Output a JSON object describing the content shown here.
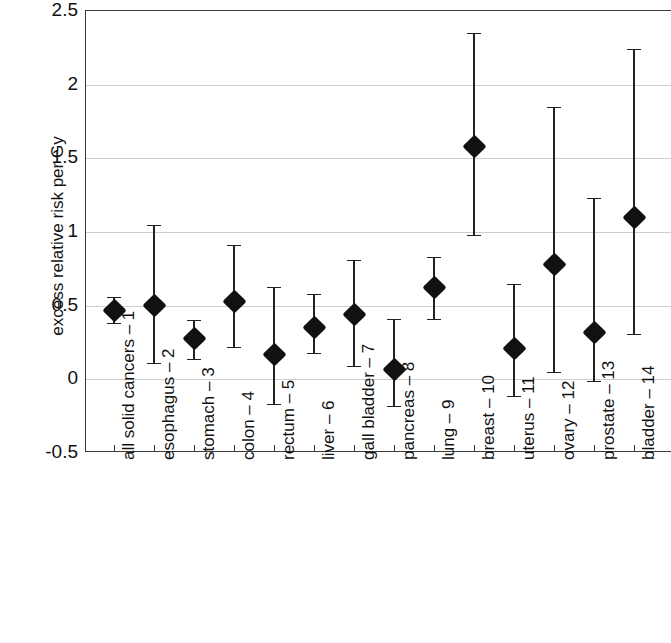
{
  "chart_data": {
    "type": "scatter",
    "title": "",
    "subtitle": "",
    "xlabel": "",
    "ylabel": "excess relative risk per Gy",
    "ylim": [
      -0.5,
      2.5
    ],
    "yticks": [
      -0.5,
      0,
      0.5,
      1,
      1.5,
      2,
      2.5
    ],
    "ytick_labels": [
      "-0.5",
      "0",
      "0.5",
      "1",
      "1.5",
      "2",
      "2.5"
    ],
    "grid": true,
    "legend": "none",
    "marker": "filled-diamond",
    "error_bars": "vertical-with-caps",
    "categories": [
      "all solid cancers – 1",
      "esophagus – 2",
      "stomach – 3",
      "colon – 4",
      "rectum – 5",
      "liver – 6",
      "gall bladder – 7",
      "pancreas – 8",
      "lung – 9",
      "breast – 10",
      "uterus – 11",
      "ovary – 12",
      "prostate – 13",
      "bladder – 14"
    ],
    "xtick_labels": [
      "all solid cancers – 1",
      "esophagus – 2",
      "stomach – 3",
      "colon – 4",
      "rectum – 5",
      "liver – 6",
      "gall bladder – 7",
      "pancreas – 8",
      "lung – 9",
      "breast – 10",
      "uterus – 11",
      "ovary – 12",
      "prostate – 13",
      "bladder – 14"
    ],
    "values": [
      0.47,
      0.5,
      0.28,
      0.53,
      0.17,
      0.35,
      0.44,
      0.07,
      0.62,
      1.58,
      0.21,
      0.78,
      0.32,
      1.1
    ],
    "error_low": [
      0.38,
      0.11,
      0.14,
      0.22,
      -0.17,
      0.18,
      0.09,
      -0.18,
      0.41,
      0.98,
      -0.11,
      0.05,
      -0.01,
      0.31
    ],
    "error_high": [
      0.56,
      1.05,
      0.4,
      0.91,
      0.63,
      0.58,
      0.81,
      0.41,
      0.83,
      2.35,
      0.65,
      1.85,
      1.23,
      2.24
    ],
    "points": [
      {
        "label": "all solid cancers – 1",
        "index": 1,
        "value": 0.47,
        "low": 0.38,
        "high": 0.56
      },
      {
        "label": "esophagus – 2",
        "index": 2,
        "value": 0.5,
        "low": 0.11,
        "high": 1.05
      },
      {
        "label": "stomach – 3",
        "index": 3,
        "value": 0.28,
        "low": 0.14,
        "high": 0.4
      },
      {
        "label": "colon – 4",
        "index": 4,
        "value": 0.53,
        "low": 0.22,
        "high": 0.91
      },
      {
        "label": "rectum – 5",
        "index": 5,
        "value": 0.17,
        "low": -0.17,
        "high": 0.63
      },
      {
        "label": "liver – 6",
        "index": 6,
        "value": 0.35,
        "low": 0.18,
        "high": 0.58
      },
      {
        "label": "gall bladder – 7",
        "index": 7,
        "value": 0.44,
        "low": 0.09,
        "high": 0.81
      },
      {
        "label": "pancreas – 8",
        "index": 8,
        "value": 0.07,
        "low": -0.18,
        "high": 0.41
      },
      {
        "label": "lung – 9",
        "index": 9,
        "value": 0.62,
        "low": 0.41,
        "high": 0.83
      },
      {
        "label": "breast – 10",
        "index": 10,
        "value": 1.58,
        "low": 0.98,
        "high": 2.35
      },
      {
        "label": "uterus – 11",
        "index": 11,
        "value": 0.21,
        "low": -0.11,
        "high": 0.65
      },
      {
        "label": "ovary – 12",
        "index": 12,
        "value": 0.78,
        "low": 0.05,
        "high": 1.85
      },
      {
        "label": "prostate – 13",
        "index": 13,
        "value": 0.32,
        "low": -0.01,
        "high": 1.23
      },
      {
        "label": "bladder – 14",
        "index": 14,
        "value": 1.1,
        "low": 0.31,
        "high": 2.24
      }
    ],
    "colors": {
      "marker": "#111111",
      "error_bar": "#222222",
      "gridline": "#cfcfcf",
      "axis": "#3a3a3a",
      "background": "#ffffff",
      "text": "#111111"
    }
  }
}
